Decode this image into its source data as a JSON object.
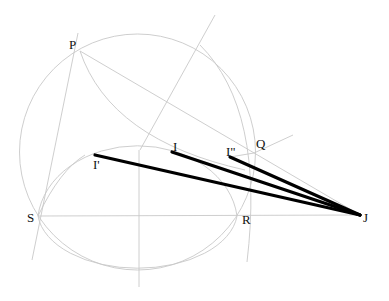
{
  "diagram": {
    "type": "geometric construction",
    "colors": {
      "guide": "#c8c8c8",
      "segment": "#000000",
      "label": "#111111"
    },
    "points": {
      "P": {
        "label": "P",
        "x": 80,
        "y": 51
      },
      "Q": {
        "label": "Q",
        "x": 254,
        "y": 153
      },
      "S": {
        "label": "S",
        "x": 38,
        "y": 216
      },
      "R": {
        "label": "R",
        "x": 237,
        "y": 216
      },
      "J": {
        "label": "J",
        "x": 360,
        "y": 215
      },
      "I": {
        "label": "I",
        "x": 172,
        "y": 152
      },
      "I1": {
        "label": "I'",
        "x": 95,
        "y": 155
      },
      "I2": {
        "label": "I\"",
        "x": 230,
        "y": 157
      }
    },
    "bold_segments": [
      {
        "from": "I'",
        "to": "J"
      },
      {
        "from": "I",
        "to": "J"
      },
      {
        "from": "I\"",
        "to": "J"
      }
    ]
  }
}
